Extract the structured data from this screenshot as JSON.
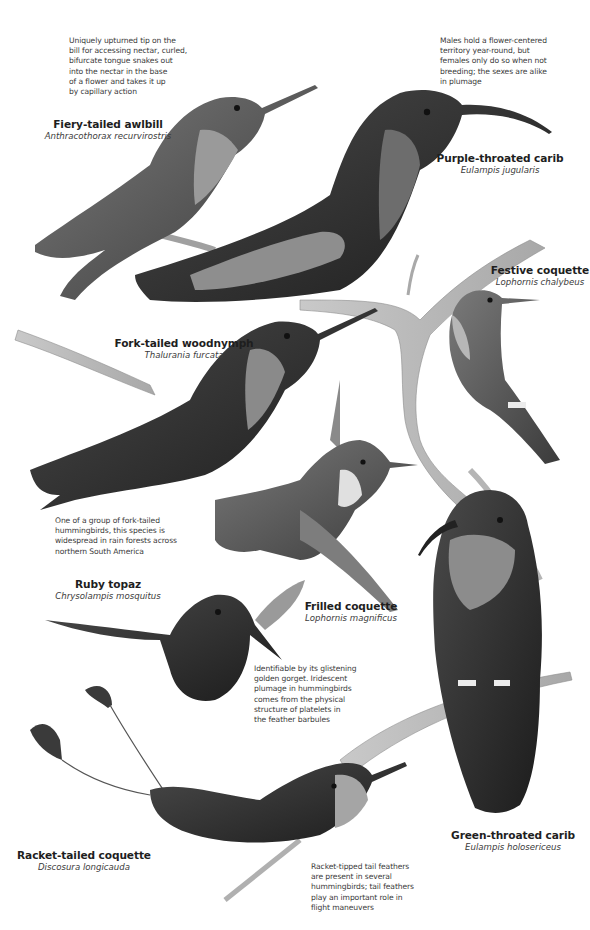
{
  "page": {
    "background": "#ffffff",
    "tone": "grayscale illustration"
  },
  "captions": [
    {
      "id": "awlbill-note",
      "lines": [
        "Uniquely upturned tip on the",
        "bill for accessing nectar, curled,",
        "bifurcate tongue snakes out",
        "into the nectar in the base",
        "of a flower and takes it up",
        "by capillary action"
      ]
    },
    {
      "id": "purple-carib-note",
      "lines": [
        "Males hold a flower-centered",
        "territory year-round, but",
        "females only do so when not",
        "breeding; the sexes are alike",
        "in plumage"
      ]
    },
    {
      "id": "woodnymph-note",
      "lines": [
        "One of a group of fork-tailed",
        "hummingbirds, this species is",
        "widespread in rain forests across",
        "northern South America"
      ]
    },
    {
      "id": "ruby-topaz-note",
      "lines": [
        "Identifiable by its glistening",
        "golden gorget. Iridescent",
        "plumage in hummingbirds",
        "comes from the physical",
        "structure of platelets in",
        "the feather barbules"
      ]
    },
    {
      "id": "racket-note",
      "lines": [
        "Racket-tipped tail feathers",
        "are present in several",
        "hummingbirds; tail feathers",
        "play an important role in",
        "flight maneuvers"
      ]
    }
  ],
  "species": [
    {
      "id": "fiery-tailed-awlbill",
      "common": "Fiery-tailed awlbill",
      "scientific": "Anthracothorax recurvirostris"
    },
    {
      "id": "purple-throated-carib",
      "common": "Purple-throated carib",
      "scientific": "Eulampis jugularis"
    },
    {
      "id": "festive-coquette",
      "common": "Festive coquette",
      "scientific": "Lophornis chalybeus"
    },
    {
      "id": "fork-tailed-woodnymph",
      "common": "Fork-tailed woodnymph",
      "scientific": "Thalurania furcata"
    },
    {
      "id": "ruby-topaz",
      "common": "Ruby topaz",
      "scientific": "Chrysolampis mosquitus"
    },
    {
      "id": "frilled-coquette",
      "common": "Frilled coquette",
      "scientific": "Lophornis magnificus"
    },
    {
      "id": "racket-tailed-coquette",
      "common": "Racket-tailed coquette",
      "scientific": "Discosura longicauda"
    },
    {
      "id": "green-throated-carib",
      "common": "Green-throated carib",
      "scientific": "Eulampis holosericeus"
    }
  ]
}
